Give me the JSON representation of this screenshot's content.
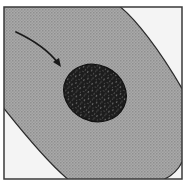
{
  "figure": {
    "colors": {
      "background": "#f4f4f4",
      "frame": "#3a3a3a",
      "cytoplasm": "#a9a9a9",
      "cytoplasm_pattern": "#8e8e8e",
      "outline": "#2a2a2a",
      "nucleus": "#1c1c1c",
      "nucleus_speckle": "#8a8a8a",
      "arrow": "#1a1a1a"
    },
    "labels": []
  }
}
